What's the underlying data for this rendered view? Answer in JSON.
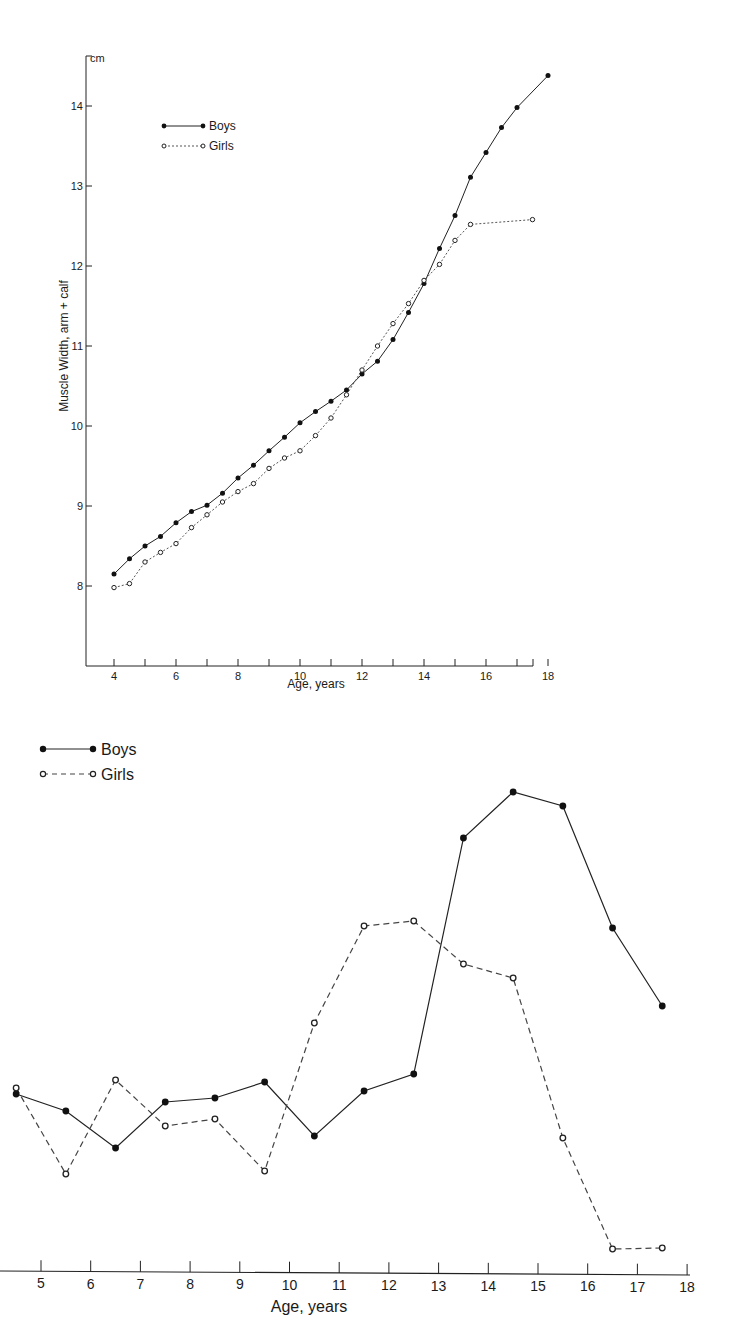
{
  "chart_data": [
    {
      "type": "line",
      "title": "",
      "ylabel": "Muscle Width, arm + calf",
      "yunit": "cm",
      "xlabel": "Age, years",
      "xlim": [
        3.2,
        18.5
      ],
      "ylim": [
        7.2,
        14.7
      ],
      "xticks": [
        4,
        5,
        6,
        7,
        8,
        9,
        10,
        11,
        12,
        13,
        14,
        15,
        16,
        17,
        18
      ],
      "xtick_labels": [
        "4",
        "6",
        "8",
        "10",
        "12",
        "14",
        "16",
        "18"
      ],
      "yticks": [
        8,
        9,
        10,
        11,
        12,
        13,
        14
      ],
      "grid": false,
      "legend_position": "upper-left-inside",
      "series": [
        {
          "name": "Boys",
          "style": "solid-filled-dot",
          "x": [
            4,
            4.5,
            5,
            5.5,
            6,
            6.5,
            7,
            7.5,
            8,
            8.5,
            9,
            9.5,
            10,
            10.5,
            11,
            11.5,
            12,
            12.5,
            13,
            13.5,
            14,
            14.5,
            15,
            15.5,
            16,
            16.5,
            17,
            18
          ],
          "values": [
            8.15,
            8.34,
            8.5,
            8.62,
            8.79,
            8.93,
            9.01,
            9.16,
            9.35,
            9.51,
            9.69,
            9.86,
            10.04,
            10.18,
            10.31,
            10.45,
            10.65,
            10.81,
            11.08,
            11.42,
            11.78,
            12.22,
            12.63,
            13.11,
            13.42,
            13.73,
            13.98,
            14.38
          ]
        },
        {
          "name": "Girls",
          "style": "dashed-open-dot",
          "x": [
            4,
            4.5,
            5,
            5.5,
            6,
            6.5,
            7,
            7.5,
            8,
            8.5,
            9,
            9.5,
            10,
            10.5,
            11,
            11.5,
            12,
            12.5,
            13,
            13.5,
            14,
            14.5,
            15,
            15.5,
            17.5
          ],
          "values": [
            7.98,
            8.03,
            8.3,
            8.42,
            8.53,
            8.73,
            8.89,
            9.05,
            9.18,
            9.28,
            9.47,
            9.6,
            9.69,
            9.88,
            10.1,
            10.39,
            10.7,
            11.0,
            11.28,
            11.53,
            11.82,
            12.02,
            12.32,
            12.52,
            12.58
          ]
        }
      ]
    },
    {
      "type": "line",
      "title": "",
      "xlabel": "Age, years",
      "ylabel": "",
      "note": "y-axis not visible in image; values are relative heights (0 = x-axis baseline, higher = larger)",
      "xlim": [
        4.1,
        18
      ],
      "xticks": [
        5,
        6,
        7,
        8,
        9,
        10,
        11,
        12,
        13,
        14,
        15,
        16,
        17,
        18
      ],
      "xtick_labels": [
        "5",
        "6",
        "7",
        "8",
        "9",
        "10",
        "11",
        "12",
        "13",
        "14",
        "15",
        "16",
        "17",
        "18"
      ],
      "grid": false,
      "legend_position": "upper-left-outside",
      "series": [
        {
          "name": "Boys",
          "style": "solid-filled-dot",
          "x": [
            4.5,
            5.5,
            6.5,
            7.5,
            8.5,
            9.5,
            10.5,
            11.5,
            12.5,
            13.5,
            14.5,
            15.5,
            16.5,
            17.5
          ],
          "values": [
            178,
            161,
            124,
            170,
            174,
            190,
            136,
            181,
            198,
            434,
            480,
            466,
            344,
            266
          ]
        },
        {
          "name": "Girls",
          "style": "dashed-open-dot",
          "x": [
            4.5,
            5.5,
            6.5,
            7.5,
            8.5,
            9.5,
            10.5,
            11.5,
            12.5,
            13.5,
            14.5,
            15.5,
            16.5,
            17.5
          ],
          "values": [
            184,
            98,
            192,
            146,
            153,
            101,
            249,
            346,
            351,
            308,
            294,
            134,
            23,
            24
          ]
        }
      ]
    }
  ],
  "top": {
    "unit_label": "cm",
    "ylabel": "Muscle Width, arm + calf",
    "xlabel": "Age, years",
    "legend": {
      "boys": "Boys",
      "girls": "Girls"
    }
  },
  "bottom": {
    "xlabel": "Age, years",
    "legend": {
      "boys": "Boys",
      "girls": "Girls"
    }
  }
}
